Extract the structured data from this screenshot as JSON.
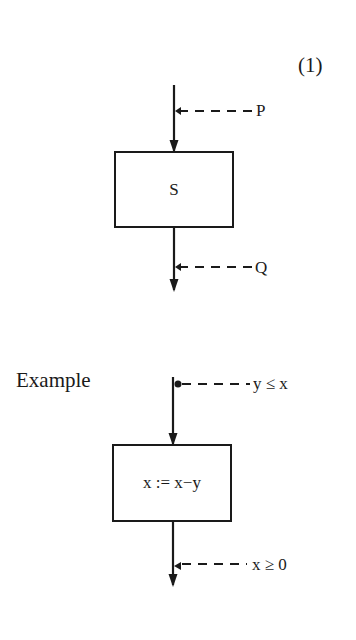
{
  "equation_number": "(1)",
  "diagram1": {
    "statement": "S",
    "precondition": "P",
    "postcondition": "Q"
  },
  "example": {
    "heading": "Example",
    "statement": "x := x−y",
    "precondition": "y ≤ x",
    "postcondition": "x ≥ 0"
  },
  "colors": {
    "ink": "#1a1a1a",
    "background": "#ffffff"
  }
}
